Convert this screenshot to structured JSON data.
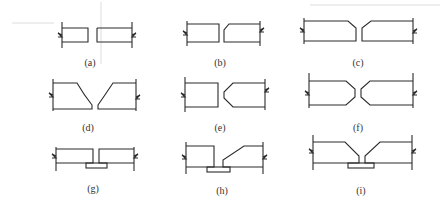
{
  "figure": {
    "panels": [
      {
        "id": "a",
        "label": "(a)",
        "type": "square butt, gap"
      },
      {
        "id": "b",
        "label": "(b)",
        "type": "single bevel small"
      },
      {
        "id": "c",
        "label": "(c)",
        "type": "double single-V small"
      },
      {
        "id": "d",
        "label": "(d)",
        "type": "U groove"
      },
      {
        "id": "e",
        "label": "(e)",
        "type": "one side double bevel (K)"
      },
      {
        "id": "f",
        "label": "(f)",
        "type": "double-V (X) groove"
      },
      {
        "id": "g",
        "label": "(g)",
        "type": "square butt with backing strip"
      },
      {
        "id": "h",
        "label": "(h)",
        "type": "single bevel with backing strip"
      },
      {
        "id": "i",
        "label": "(i)",
        "type": "single-V with backing strip"
      }
    ]
  },
  "colors": {
    "line": "#2a2a2a",
    "background": "#ffffff",
    "ghost": "#eeeeee"
  }
}
